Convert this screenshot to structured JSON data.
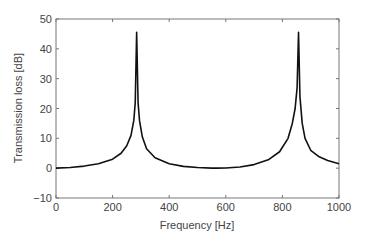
{
  "chart_data": {
    "type": "line",
    "title": "",
    "xlabel": "Frequency [Hz]",
    "ylabel": "Transmission loss [dB]",
    "xlim": [
      0,
      1000
    ],
    "ylim": [
      -10,
      50
    ],
    "xticks": [
      0,
      200,
      400,
      600,
      800,
      1000
    ],
    "yticks": [
      -10,
      0,
      10,
      20,
      30,
      40,
      50
    ],
    "xtick_labels": [
      "0",
      "200",
      "400",
      "600",
      "800",
      "1000"
    ],
    "ytick_labels": [
      "−10",
      "0",
      "10",
      "20",
      "30",
      "40",
      "50"
    ],
    "grid": false,
    "legend": null,
    "series": [
      {
        "name": "Transmission loss",
        "color": "#111111",
        "peaks": [
          {
            "x": 285,
            "y": 45.5
          },
          {
            "x": 857,
            "y": 45.5
          }
        ],
        "x": [
          0,
          50,
          100,
          150,
          200,
          230,
          250,
          265,
          275,
          280,
          285,
          290,
          295,
          305,
          320,
          350,
          400,
          450,
          500,
          550,
          570,
          600,
          650,
          700,
          750,
          790,
          820,
          835,
          845,
          852,
          857,
          862,
          870,
          880,
          900,
          930,
          960,
          1000
        ],
        "y": [
          0,
          0.2,
          0.7,
          1.5,
          3.0,
          5.0,
          7.5,
          11,
          16,
          22,
          45.5,
          22,
          16,
          10.5,
          6.5,
          3.5,
          1.5,
          0.6,
          0.2,
          0.0,
          0.0,
          0.05,
          0.4,
          1.2,
          2.8,
          5.5,
          10,
          15,
          20,
          27,
          45.5,
          24,
          15,
          10,
          6,
          3.8,
          2.6,
          1.5
        ]
      }
    ]
  }
}
